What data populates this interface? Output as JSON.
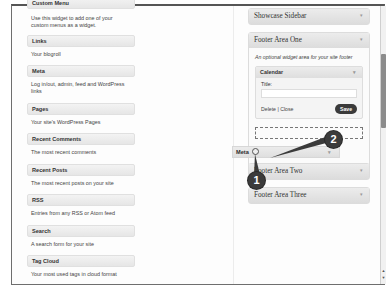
{
  "available_widgets": [
    {
      "title": "Custom Menu",
      "description": "Use this widget to add one of your custom menus as a widget."
    },
    {
      "title": "Links",
      "description": "Your blogroll"
    },
    {
      "title": "Meta",
      "description": "Log in/out, admin, feed and WordPress links"
    },
    {
      "title": "Pages",
      "description": "Your site's WordPress Pages"
    },
    {
      "title": "Recent Comments",
      "description": "The most recent comments"
    },
    {
      "title": "Recent Posts",
      "description": "The most recent posts on your site"
    },
    {
      "title": "RSS",
      "description": "Entries from any RSS or Atom feed"
    },
    {
      "title": "Search",
      "description": "A search form for your site"
    },
    {
      "title": "Tag Cloud",
      "description": "Your most used tags in cloud format"
    }
  ],
  "sidebars": {
    "showcase": {
      "title": "Showcase Sidebar"
    },
    "footer_one": {
      "title": "Footer Area One",
      "description": "An optional widget area for your site footer",
      "calendar_widget": {
        "title": "Calendar",
        "field_label": "Title:",
        "field_value": "",
        "links": "Delete | Close",
        "save_label": "Save"
      }
    },
    "footer_two": {
      "title": "Footer Area Two"
    },
    "footer_three": {
      "title": "Footer Area Three"
    }
  },
  "dragged_widget": {
    "title": "Meta"
  },
  "callouts": {
    "one": "1",
    "two": "2"
  },
  "icons": {
    "collapse_arrow": "▾",
    "scroll_up": "▲",
    "scroll_down": "▼"
  }
}
